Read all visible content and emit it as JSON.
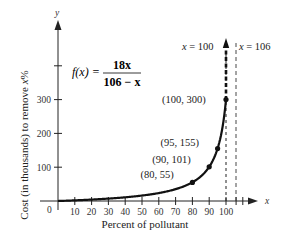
{
  "chart_data": {
    "type": "line",
    "title": "",
    "function_label": "f(x) =",
    "function_numerator": "18x",
    "function_denominator": "106 − x",
    "xlabel": "Percent of pollutant",
    "ylabel": "Cost (in thousands) to remove x%",
    "x_axis_symbol": "x",
    "y_axis_symbol": "y",
    "origin_label": "0",
    "xlim": [
      0,
      110
    ],
    "ylim": [
      0,
      420
    ],
    "x_ticks": [
      10,
      20,
      30,
      40,
      50,
      60,
      70,
      80,
      90,
      100
    ],
    "x_tick_labels": [
      "10",
      "20",
      "30",
      "40",
      "50",
      "60",
      "70",
      "80",
      "90",
      "100"
    ],
    "y_ticks": [
      100,
      200,
      300,
      400
    ],
    "y_tick_labels": [
      "100",
      "200",
      "300",
      ""
    ],
    "series": [
      {
        "name": "f(x) = 18x / (106 − x)",
        "x": [
          0,
          10,
          20,
          30,
          40,
          50,
          60,
          70,
          80,
          90,
          95,
          100
        ],
        "values": [
          0,
          1.9,
          4.2,
          7.1,
          10.9,
          16.1,
          23.5,
          35,
          55,
          101,
          155,
          300
        ]
      }
    ],
    "labeled_points": [
      {
        "x": 80,
        "y": 55,
        "label": "(80, 55)"
      },
      {
        "x": 90,
        "y": 101,
        "label": "(90, 101)"
      },
      {
        "x": 95,
        "y": 155,
        "label": "(95, 155)"
      },
      {
        "x": 100,
        "y": 300,
        "label": "(100, 300)"
      }
    ],
    "vertical_lines": [
      {
        "x": 100,
        "label": "x = 100",
        "style": "heavy-dashed"
      },
      {
        "x": 106,
        "label": "x = 106",
        "style": "thin-dashed"
      }
    ],
    "grid": false,
    "legend": null
  }
}
